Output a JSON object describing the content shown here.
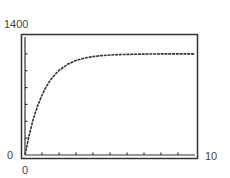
{
  "chart_data": {
    "type": "line",
    "title": "",
    "xlabel": "",
    "ylabel": "",
    "xlim": [
      0,
      10
    ],
    "ylim": [
      0,
      1400
    ],
    "x_tick_labels": {
      "min": "0",
      "max": "10"
    },
    "y_tick_labels": {
      "min": "0",
      "max": "1400"
    },
    "x_ticks_count": 10,
    "y_ticks_count": 7,
    "grid": false,
    "legend": null,
    "series": [
      {
        "name": "curve",
        "x": [
          0,
          0.25,
          0.5,
          0.75,
          1,
          1.25,
          1.5,
          1.75,
          2,
          2.5,
          3,
          3.5,
          4,
          4.5,
          5,
          5.5,
          6,
          7,
          8,
          9,
          10
        ],
        "y": [
          0,
          241,
          435,
          588,
          712,
          811,
          890,
          953,
          1004,
          1076,
          1122,
          1150,
          1168,
          1179,
          1186,
          1191,
          1194,
          1197,
          1199,
          1200,
          1200
        ]
      }
    ]
  },
  "axis_labels": {
    "y_max": "1400",
    "y_min": "0",
    "x_min": "0",
    "x_max": "10"
  },
  "colors": {
    "line": "#333333",
    "frame": "#333333",
    "text": "#444444"
  }
}
